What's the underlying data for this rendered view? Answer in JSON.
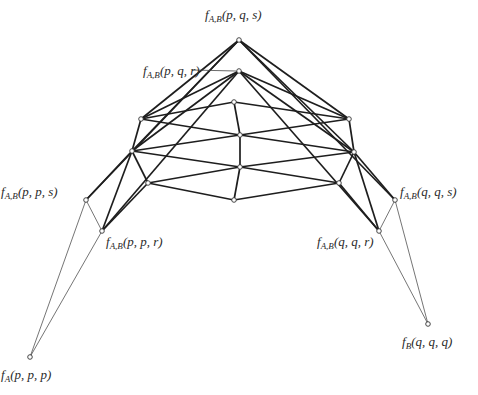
{
  "diagram": {
    "labels": [
      {
        "id": "top",
        "func": "f",
        "sub": "A,B",
        "args": "(p, q, s)",
        "x": 205,
        "y": 8
      },
      {
        "id": "pqr",
        "func": "f",
        "sub": "A,B",
        "args": "(p, q, r)",
        "x": 143,
        "y": 64
      },
      {
        "id": "pps",
        "func": "f",
        "sub": "A,B",
        "args": "(p, p, s)",
        "x": 1,
        "y": 185
      },
      {
        "id": "ppr",
        "func": "f",
        "sub": "A,B",
        "args": "(p, p, r)",
        "x": 106,
        "y": 235
      },
      {
        "id": "qqs",
        "func": "f",
        "sub": "A,B",
        "args": "(q, q, s)",
        "x": 400,
        "y": 185
      },
      {
        "id": "qqr",
        "func": "f",
        "sub": "A,B",
        "args": "(q, q, r)",
        "x": 317,
        "y": 235
      },
      {
        "id": "ppp",
        "func": "f",
        "sub": "A",
        "args": "(p, p, p)",
        "x": 1,
        "y": 368
      },
      {
        "id": "qqq",
        "func": "f",
        "sub": "B",
        "args": "(q, q, q)",
        "x": 402,
        "y": 335
      }
    ],
    "nodes": {
      "apex": [
        239,
        40
      ],
      "second": [
        239,
        71
      ],
      "c1": [
        234,
        102
      ],
      "c2": [
        240,
        135
      ],
      "c3": [
        240,
        167
      ],
      "c4": [
        234,
        200
      ],
      "l1": [
        141,
        119
      ],
      "l2": [
        132,
        151
      ],
      "l3": [
        148,
        183
      ],
      "r1": [
        349,
        119
      ],
      "r2": [
        354,
        152
      ],
      "r3": [
        339,
        183
      ],
      "pps": [
        86,
        200
      ],
      "ppr": [
        102,
        231
      ],
      "qqs": [
        395,
        200
      ],
      "qqr": [
        379,
        231
      ],
      "ppp": [
        30,
        357
      ],
      "qqq": [
        428,
        324
      ]
    },
    "thick_edges": [
      [
        "apex",
        "l1"
      ],
      [
        "apex",
        "l2"
      ],
      [
        "apex",
        "pps"
      ],
      [
        "apex",
        "r1"
      ],
      [
        "apex",
        "r2"
      ],
      [
        "apex",
        "qqs"
      ],
      [
        "second",
        "l1"
      ],
      [
        "second",
        "l2"
      ],
      [
        "second",
        "ppr"
      ],
      [
        "second",
        "r1"
      ],
      [
        "second",
        "r2"
      ],
      [
        "second",
        "qqr"
      ],
      [
        "l1",
        "c1"
      ],
      [
        "l1",
        "c2"
      ],
      [
        "l2",
        "c2"
      ],
      [
        "l2",
        "c3"
      ],
      [
        "l3",
        "c3"
      ],
      [
        "l3",
        "c4"
      ],
      [
        "r1",
        "c1"
      ],
      [
        "r1",
        "c2"
      ],
      [
        "r2",
        "c2"
      ],
      [
        "r2",
        "c3"
      ],
      [
        "r3",
        "c3"
      ],
      [
        "r3",
        "c4"
      ],
      [
        "c1",
        "c2"
      ],
      [
        "c2",
        "c3"
      ],
      [
        "c3",
        "c4"
      ],
      [
        "l1",
        "l2"
      ],
      [
        "l2",
        "l3"
      ],
      [
        "r1",
        "r2"
      ],
      [
        "r2",
        "r3"
      ],
      [
        "l2",
        "pps"
      ],
      [
        "l2",
        "ppr"
      ],
      [
        "l3",
        "ppr"
      ],
      [
        "r2",
        "qqs"
      ],
      [
        "r2",
        "qqr"
      ],
      [
        "r3",
        "qqr"
      ]
    ],
    "thin_edges": [
      [
        "pps",
        "ppr"
      ],
      [
        "pps",
        "ppp"
      ],
      [
        "ppr",
        "ppp"
      ],
      [
        "qqs",
        "qqr"
      ],
      [
        "qqs",
        "qqq"
      ],
      [
        "qqr",
        "qqq"
      ]
    ],
    "leader_line": {
      "from": [
        192,
        70
      ],
      "to": [
        236,
        71
      ]
    }
  }
}
